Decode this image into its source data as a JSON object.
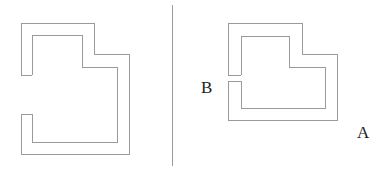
{
  "diagram": {
    "background": "#ffffff",
    "stroke_color": "#9a9a9a",
    "divider": {
      "x": 172,
      "y1": 5,
      "y2": 166
    },
    "left_figure": {
      "description": "L-shaped open channel with wide opening on the left side",
      "outer_path": "21,75 21,23 94,23 94,54 129,54 129,154 21,154 21,114",
      "inner_path": "32,75 32,35 82,35 82,67 117,67 117,142 32,142 32,114",
      "upper_cap": "21,75 32,75",
      "lower_cap": "21,114 32,114"
    },
    "right_figure": {
      "description": "L-shaped channel with narrow gap on the left side at point B",
      "outer_path": "228,75 228,23 302,23 302,54 337,54 337,120 228,120 228,81",
      "inner_path": "241,75 241,36 289,36 289,67 325,67 325,108 241,108 241,81",
      "upper_cap": "228,75 241,75",
      "lower_cap": "228,81 241,81"
    },
    "labels": {
      "b": {
        "text": "B",
        "x": 201,
        "y": 79
      },
      "a": {
        "text": "A",
        "x": 357,
        "y": 124
      }
    }
  }
}
